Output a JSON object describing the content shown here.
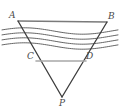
{
  "figure": {
    "type": "geometry-diagram",
    "canvas": {
      "width": 120,
      "height": 111,
      "background": "#ffffff"
    },
    "colors": {
      "triangle_side": "#3d3d3d",
      "top_segment": "#7a7a7a",
      "mid_segment": "#a8a8a8",
      "wave": "#555555",
      "label": "#4a4a4a"
    },
    "points": [
      {
        "id": "A",
        "label": "A",
        "x": 18,
        "y": 21,
        "label_x": 9,
        "label_y": 11
      },
      {
        "id": "B",
        "label": "B",
        "x": 107,
        "y": 22,
        "label_x": 108,
        "label_y": 12
      },
      {
        "id": "C",
        "label": "C",
        "x": 36,
        "y": 61,
        "label_x": 27,
        "label_y": 52
      },
      {
        "id": "D",
        "label": "D",
        "x": 86,
        "y": 61,
        "label_x": 86,
        "label_y": 52
      },
      {
        "id": "P",
        "label": "P",
        "x": 62,
        "y": 97,
        "label_x": 59,
        "label_y": 99
      }
    ],
    "segments": [
      {
        "id": "AB",
        "from": "A",
        "to": "B",
        "style": "top_segment",
        "width": 1.4
      },
      {
        "id": "AP",
        "from": "A",
        "to": "P",
        "style": "triangle_side",
        "width": 1.3
      },
      {
        "id": "BP",
        "from": "B",
        "to": "P",
        "style": "triangle_side",
        "width": 1.3
      },
      {
        "id": "CD",
        "from": "C",
        "to": "D",
        "style": "mid_segment",
        "width": 1.6
      }
    ],
    "waves": {
      "count": 4,
      "x_start": 2,
      "x_end": 118,
      "baselines": [
        31,
        36,
        41,
        46
      ],
      "amplitude": 3.2,
      "stroke_width": 0.9
    }
  }
}
